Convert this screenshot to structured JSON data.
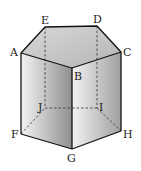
{
  "diagram": {
    "type": "pentagonal-prism",
    "labels": {
      "A": "A",
      "B": "B",
      "C": "C",
      "D": "D",
      "E": "E",
      "F": "F",
      "G": "G",
      "H": "H",
      "I": "I",
      "J": "J"
    },
    "top_face": [
      "A",
      "B",
      "C",
      "D",
      "E"
    ],
    "bottom_face": [
      "F",
      "G",
      "H",
      "I",
      "J"
    ],
    "hidden_edges": [
      "E-J",
      "D-I",
      "J-I",
      "F-J",
      "I-H"
    ]
  }
}
